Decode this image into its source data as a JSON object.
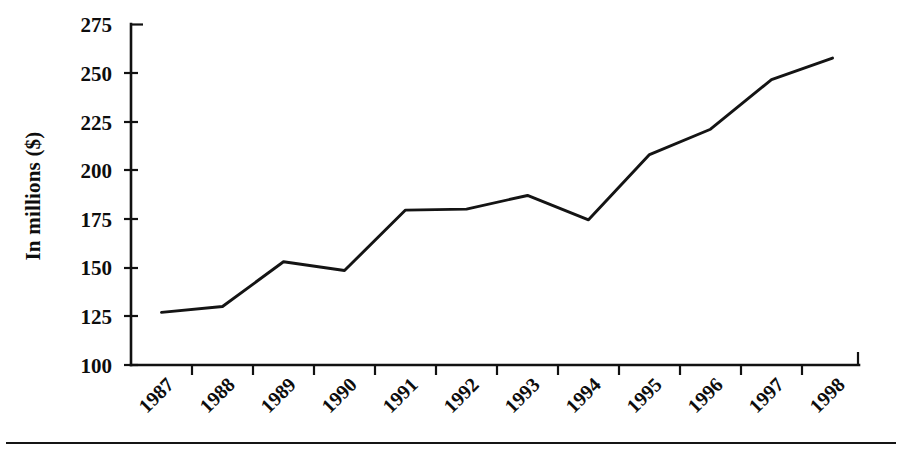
{
  "chart_data": {
    "type": "line",
    "title": "",
    "subtitle": "",
    "xlabel": "",
    "ylabel": "In millions ($)",
    "categories": [
      "1987",
      "1988",
      "1989",
      "1990",
      "1991",
      "1992",
      "1993",
      "1994",
      "1995",
      "1996",
      "1997",
      "1998"
    ],
    "x": [
      "1987",
      "1988",
      "1989",
      "1990",
      "1991",
      "1992",
      "1993",
      "1994",
      "1995",
      "1996",
      "1997",
      "1998"
    ],
    "values": [
      127,
      130,
      153,
      148.5,
      179.5,
      180,
      187,
      174.5,
      208,
      221,
      246.5,
      257.5
    ],
    "series": [
      {
        "name": "In millions ($)",
        "values": [
          127,
          130,
          153,
          148.5,
          179.5,
          180,
          187,
          174.5,
          208,
          221,
          246.5,
          257.5
        ]
      }
    ],
    "ylim": [
      100,
      275
    ],
    "yticks": [
      100,
      125,
      150,
      175,
      200,
      225,
      250,
      275
    ],
    "ytick_labels": [
      "100",
      "125",
      "150",
      "175",
      "200",
      "225",
      "250",
      "275"
    ],
    "xtick_labels": [
      "1987",
      "1988",
      "1989",
      "1990",
      "1991",
      "1992",
      "1993",
      "1994",
      "1995",
      "1996",
      "1997",
      "1998"
    ],
    "xtick_label_rotation_degrees": -45,
    "grid": false,
    "legend": false,
    "legend_position": "none",
    "line_color": "#141414",
    "axis_color": "#111111",
    "background_color": "#ffffff",
    "annotations": []
  },
  "figure": {
    "y_axis_title": "In millions ($)",
    "footer_rule_label": "horizontal-rule"
  }
}
